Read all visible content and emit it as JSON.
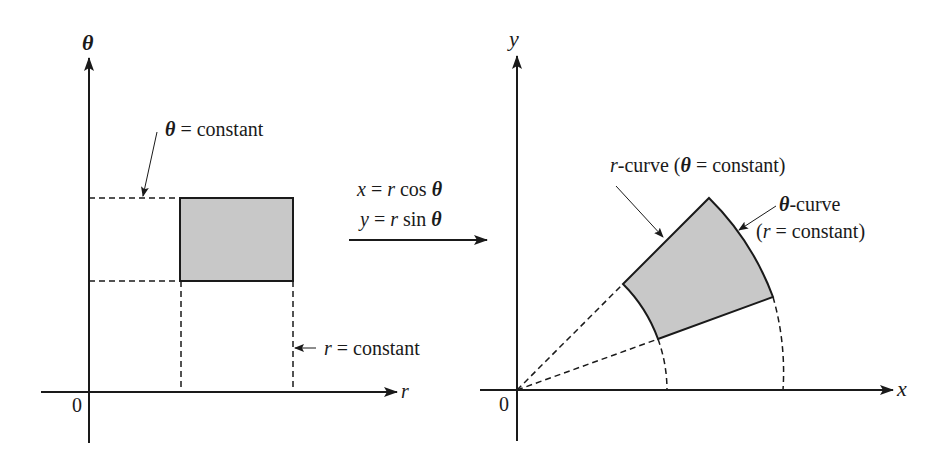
{
  "figure": {
    "left_panel": {
      "vertical_axis_label": "θ",
      "horizontal_axis_label": "r",
      "origin_label": "0",
      "theta_constant_label": {
        "var": "θ",
        "rest": " = constant"
      },
      "r_constant_label": {
        "var": "r",
        "rest": " = constant"
      },
      "region_fill": "#c8c8c8"
    },
    "transform": {
      "line1": {
        "lhs": "x",
        "mid": " = ",
        "var": "r",
        "fn": " cos ",
        "arg": "θ"
      },
      "line2": {
        "lhs": "y",
        "mid": " = ",
        "var": "r",
        "fn": " sin ",
        "arg": "θ"
      }
    },
    "right_panel": {
      "vertical_axis_label": "y",
      "horizontal_axis_label": "x",
      "origin_label": "0",
      "r_curve_label": {
        "var": "r",
        "rest": "-curve (",
        "theta": "θ",
        "rest2": " = constant)"
      },
      "theta_curve_label": {
        "theta": "θ",
        "rest": "-curve"
      },
      "theta_curve_sub": {
        "open": "(",
        "var": "r",
        "rest": " = constant)"
      },
      "region_fill": "#c8c8c8"
    }
  }
}
